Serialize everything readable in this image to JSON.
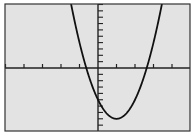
{
  "chart_data": {
    "type": "line",
    "title": "",
    "xlabel": "",
    "ylabel": "",
    "function": "y = 3x^2 - 6x - 5",
    "xlim": [
      -5,
      5
    ],
    "ylim": [
      -10,
      10
    ],
    "xscale_tick": 1,
    "yscale_tick": 1,
    "grid": false,
    "legend": "none",
    "series": [
      {
        "name": "parabola",
        "x": [
          -1.5,
          -1,
          -0.63,
          0,
          0.5,
          1,
          1.5,
          2,
          2.63,
          3,
          3.5
        ],
        "y": [
          10.75,
          4,
          0,
          -5,
          -7.25,
          -8,
          -7.25,
          -5,
          0,
          4,
          10.75
        ]
      }
    ],
    "annotations": {
      "vertex": [
        1,
        -8
      ],
      "y_intercept": -5,
      "x_intercepts": [
        -0.63,
        2.63
      ]
    }
  },
  "colors": {
    "screen_bg": "#e3e3e3",
    "axis": "#222222",
    "curve": "#111111",
    "frame": "#333333",
    "page_bg": "#ffffff"
  },
  "accessibility": {
    "label": "Graphing calculator window showing an upward-opening parabola"
  }
}
